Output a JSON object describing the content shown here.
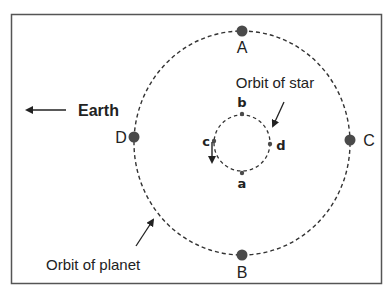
{
  "diagram": {
    "earth_label": "Earth",
    "earth_arrow_icon": "arrow-left",
    "planet_orbit_label": "Orbit of planet",
    "star_orbit_label": "Orbit of star",
    "planet_positions": [
      {
        "label": "A",
        "position": "top"
      },
      {
        "label": "B",
        "position": "bottom"
      },
      {
        "label": "C",
        "position": "right"
      },
      {
        "label": "D",
        "position": "left"
      }
    ],
    "star_positions": [
      {
        "label": "a",
        "position": "bottom"
      },
      {
        "label": "b",
        "position": "top"
      },
      {
        "label": "c",
        "position": "left"
      },
      {
        "label": "d",
        "position": "right"
      }
    ],
    "star_motion_direction": "counterclockwise",
    "colors": {
      "dot": "#4a4a4a",
      "line": "#333333",
      "border": "#555555"
    }
  }
}
